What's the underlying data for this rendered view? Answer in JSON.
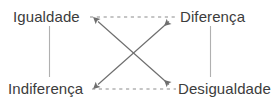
{
  "diagram": {
    "type": "semiotic-square",
    "background_color": "#ffffff",
    "width": 279,
    "height": 107,
    "nodes": [
      {
        "id": "igualdade",
        "label": "Igualdade",
        "position": "top-left"
      },
      {
        "id": "diferenca",
        "label": "Diferença",
        "position": "top-right"
      },
      {
        "id": "indiferenca",
        "label": "Indiferença",
        "position": "bottom-left"
      },
      {
        "id": "desigualdade",
        "label": "Desigualdade",
        "position": "bottom-right"
      }
    ],
    "connectors": [
      {
        "id": "top-dashed",
        "from": "igualdade",
        "to": "diferenca",
        "style": "dashed",
        "arrows": "none",
        "color": "#8c8c8c"
      },
      {
        "id": "bottom-dashed",
        "from": "indiferenca",
        "to": "desigualdade",
        "style": "dashed",
        "arrows": "none",
        "color": "#8c8c8c"
      },
      {
        "id": "left-vertical",
        "from": "igualdade",
        "to": "indiferenca",
        "style": "solid",
        "arrows": "none",
        "color": "#b0b0b0"
      },
      {
        "id": "right-vertical",
        "from": "diferenca",
        "to": "desigualdade",
        "style": "solid",
        "arrows": "none",
        "color": "#b0b0b0"
      },
      {
        "id": "diagonal-igualdade-desigualdade",
        "from": "igualdade",
        "to": "desigualdade",
        "style": "solid",
        "arrows": "both",
        "color": "#6e6e6e"
      },
      {
        "id": "diagonal-indiferenca-diferenca",
        "from": "indiferenca",
        "to": "diferenca",
        "style": "solid",
        "arrows": "both",
        "color": "#6e6e6e"
      }
    ]
  }
}
